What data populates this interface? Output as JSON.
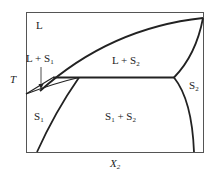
{
  "diagram": {
    "type": "phase-diagram",
    "axis": {
      "y_label": "T",
      "x_label_base": "X",
      "x_label_sub": "2"
    },
    "regions": [
      {
        "id": "L",
        "base": "L",
        "sub": ""
      },
      {
        "id": "L_S1",
        "base": "L + S",
        "sub": "1"
      },
      {
        "id": "L_S2",
        "base": "L + S",
        "sub": "2"
      },
      {
        "id": "S1",
        "base": "S",
        "sub": "1"
      },
      {
        "id": "S1_S2_a",
        "base": "S",
        "sub": "1"
      },
      {
        "id": "S1_S2_b",
        "base": " + S",
        "sub": "2"
      },
      {
        "id": "S2",
        "base": "S",
        "sub": "2"
      }
    ],
    "colors": {
      "line": "#222222",
      "frame": "#555555",
      "background": "#ffffff"
    }
  }
}
